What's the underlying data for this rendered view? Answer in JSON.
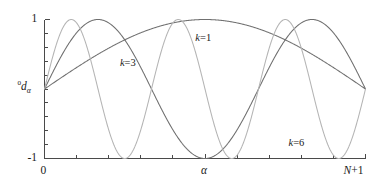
{
  "chart_data": {
    "type": "line",
    "title": "",
    "subtitle": "",
    "xlabel": "α",
    "ylabel": "⁰dₐ",
    "xlim": [
      0,
      1
    ],
    "ylim": [
      -1,
      1
    ],
    "grid": false,
    "legend_position": "inline-annotations",
    "x_tick_labels": [
      "0",
      "α",
      "N+1"
    ],
    "x_tick_positions": [
      0,
      0.5,
      1
    ],
    "x_minor_tick_count": 10,
    "y_tick_labels": [
      "1",
      "-1"
    ],
    "y_tick_positions": [
      1,
      -1
    ],
    "y_minor_tick_count": 10,
    "x_description": "index α from 0 to N+1",
    "y_description": "eigenvector component ⁰dₐ, normalized amplitude",
    "formula": "sin(kπα/(N+1))",
    "series": [
      {
        "name": "k=1",
        "k": 1,
        "color": "#707070",
        "label": "k=1",
        "label_x": 0.47,
        "label_y": 0.8,
        "x": [
          0,
          0.05,
          0.1,
          0.15,
          0.2,
          0.25,
          0.3,
          0.35,
          0.4,
          0.45,
          0.5,
          0.55,
          0.6,
          0.65,
          0.7,
          0.75,
          0.8,
          0.85,
          0.9,
          0.95,
          1
        ],
        "values": [
          0,
          0.156,
          0.309,
          0.454,
          0.588,
          0.707,
          0.809,
          0.891,
          0.951,
          0.988,
          1,
          0.988,
          0.951,
          0.891,
          0.809,
          0.707,
          0.588,
          0.454,
          0.309,
          0.156,
          0
        ]
      },
      {
        "name": "k=3",
        "k": 3,
        "color": "#6e6e6e",
        "label": "k=3",
        "label_x": 0.235,
        "label_y": 0.44,
        "x": [
          0,
          0.05,
          0.1,
          0.15,
          0.2,
          0.25,
          0.3,
          0.35,
          0.4,
          0.45,
          0.5,
          0.55,
          0.6,
          0.65,
          0.7,
          0.75,
          0.8,
          0.85,
          0.9,
          0.95,
          1
        ],
        "values": [
          0,
          0.454,
          0.809,
          0.988,
          0.951,
          0.707,
          0.309,
          -0.156,
          -0.588,
          -0.891,
          -1,
          -0.891,
          -0.588,
          -0.156,
          0.309,
          0.707,
          0.951,
          0.988,
          0.809,
          0.454,
          0
        ]
      },
      {
        "name": "k=6",
        "k": 6,
        "color": "#b4b4b4",
        "label": "k=6",
        "label_x": 0.76,
        "label_y": -0.7,
        "x": [
          0,
          0.05,
          0.1,
          0.15,
          0.2,
          0.25,
          0.3,
          0.35,
          0.4,
          0.45,
          0.5,
          0.55,
          0.6,
          0.65,
          0.7,
          0.75,
          0.8,
          0.85,
          0.9,
          0.95,
          1
        ],
        "values": [
          0,
          0.809,
          0.951,
          0.309,
          -0.588,
          -1,
          -0.588,
          0.309,
          0.951,
          0.809,
          0,
          -0.809,
          -0.951,
          -0.309,
          0.588,
          1,
          0.588,
          -0.309,
          -0.951,
          -0.809,
          0
        ]
      }
    ]
  },
  "labels": {
    "y_top": "1",
    "y_bottom": "-1",
    "x_left": "0",
    "x_mid": "α",
    "x_right_italic": "N",
    "x_right_rest": "+1",
    "y_axis_sup": "0",
    "y_axis_main": "d",
    "y_axis_sub": "α",
    "k1": "k=1",
    "k3": "k=3",
    "k6": "k=6",
    "k_letter": "k"
  }
}
